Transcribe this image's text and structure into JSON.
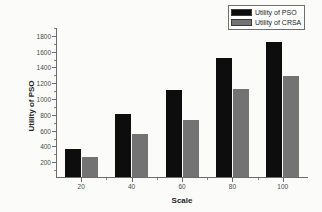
{
  "chart_data": {
    "type": "bar",
    "title": "",
    "subtitle": "",
    "xlabel": "Scale",
    "ylabel": "Utility of PSO",
    "categories": [
      "20",
      "40",
      "60",
      "80",
      "100"
    ],
    "series": [
      {
        "name": "Utility of PSO",
        "color": "#0d0d0d",
        "values": [
          350,
          800,
          1100,
          1510,
          1710
        ]
      },
      {
        "name": "Utility of CRSA",
        "color": "#737373",
        "values": [
          255,
          550,
          720,
          1120,
          1285
        ]
      }
    ],
    "ylim": [
      0,
      1900
    ],
    "ytick_labels": [
      "200",
      "400",
      "600",
      "800",
      "1000",
      "1200",
      "1400",
      "1600",
      "1800"
    ],
    "ytick_values": [
      200,
      400,
      600,
      800,
      1000,
      1200,
      1400,
      1600,
      1800
    ],
    "yminor_values": [
      100,
      300,
      500,
      700,
      900,
      1100,
      1300,
      1500,
      1700,
      1900
    ],
    "xtick_labels": [
      "20",
      "40",
      "60",
      "80",
      "100"
    ],
    "grid": false,
    "legend_position": "top-right",
    "legend_entries": [
      "Utility of PSO",
      "Utility of CRSA"
    ]
  }
}
